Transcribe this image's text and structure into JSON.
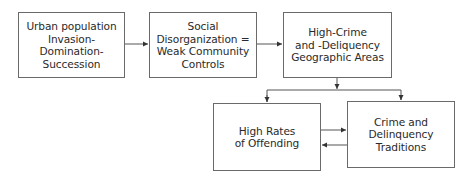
{
  "diagram": {
    "type": "flowchart",
    "nodes": [
      {
        "id": "urban",
        "label": "Urban population\nInvasion-\nDomination-\nSuccession"
      },
      {
        "id": "social",
        "label": "Social\nDisorganization =\nWeak Community\nControls"
      },
      {
        "id": "areas",
        "label": "High-Crime\nand -Deliquency\nGeographic Areas"
      },
      {
        "id": "offending",
        "label": "High Rates\nof Offending"
      },
      {
        "id": "traditions",
        "label": "Crime and\nDelinquency\nTraditions"
      }
    ],
    "edges": [
      {
        "from": "urban",
        "to": "social"
      },
      {
        "from": "social",
        "to": "areas"
      },
      {
        "from": "areas",
        "to": "offending"
      },
      {
        "from": "areas",
        "to": "traditions"
      },
      {
        "from": "offending",
        "to": "traditions"
      },
      {
        "from": "traditions",
        "to": "offending"
      }
    ],
    "colors": {
      "line": "#555555",
      "border": "#6a6a6a",
      "text": "#2a2a2a"
    }
  }
}
